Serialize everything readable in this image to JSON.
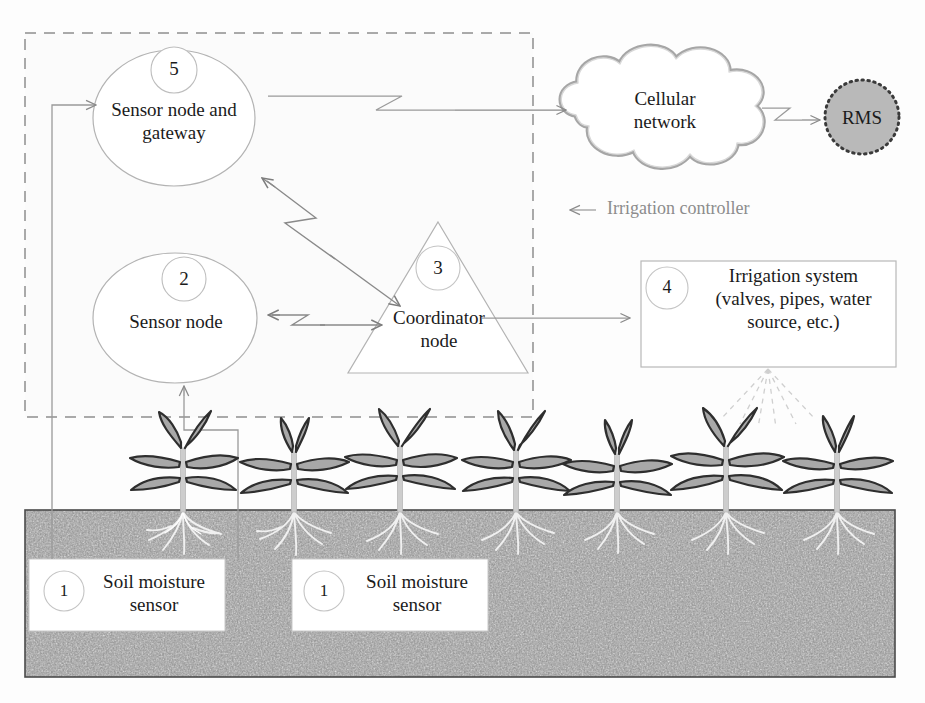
{
  "figure": {
    "boundary_label": "Irrigation controller"
  },
  "nodes": {
    "sensor_node_gateway": {
      "badge": "5",
      "label_line1": "Sensor node and",
      "label_line2": "gateway",
      "shape": "ellipse"
    },
    "sensor_node": {
      "badge": "2",
      "label_line1": "Sensor node",
      "label_line2": "",
      "shape": "ellipse"
    },
    "coordinator_node": {
      "badge": "3",
      "label_line1": "Coordinator",
      "label_line2": "node",
      "shape": "triangle"
    },
    "irrigation_system": {
      "badge": "4",
      "label_line1": "Irrigation system",
      "label_line2": "(valves, pipes, water",
      "label_line3": "source, etc.)",
      "shape": "rectangle"
    },
    "cellular_network": {
      "label_line1": "Cellular",
      "label_line2": "network",
      "shape": "cloud"
    },
    "rms": {
      "label": "RMS",
      "shape": "dotted-circle"
    },
    "soil_sensor_left": {
      "badge": "1",
      "label_line1": "Soil moisture",
      "label_line2": "sensor",
      "shape": "rectangle"
    },
    "soil_sensor_right": {
      "badge": "1",
      "label_line1": "Soil moisture",
      "label_line2": "sensor",
      "shape": "rectangle"
    }
  },
  "connections": [
    {
      "name": "gateway-to-cellular",
      "type": "wireless-arrow",
      "from": "sensor_node_gateway",
      "to": "cellular_network"
    },
    {
      "name": "cellular-to-rms",
      "type": "wireless-arrow",
      "from": "cellular_network",
      "to": "rms"
    },
    {
      "name": "gateway-coordinator",
      "type": "wireless-bidirectional",
      "from": "sensor_node_gateway",
      "to": "coordinator_node"
    },
    {
      "name": "sensornode-coordinator",
      "type": "wireless-bidirectional",
      "from": "sensor_node",
      "to": "coordinator_node"
    },
    {
      "name": "coordinator-to-irrigation",
      "type": "arrow",
      "from": "coordinator_node",
      "to": "irrigation_system"
    },
    {
      "name": "soil-sensor-left-to-gateway",
      "type": "wired-arrow",
      "from": "soil_sensor_left",
      "to": "sensor_node_gateway"
    },
    {
      "name": "soil-sensor-right-to-sensornode",
      "type": "wired-arrow",
      "from": "soil_sensor_right",
      "to": "sensor_node"
    },
    {
      "name": "irrigation-water-spray",
      "type": "dashed-fan",
      "from": "irrigation_system",
      "to": "field"
    }
  ],
  "scene": {
    "plant_count": 7,
    "soil_label": "soil bed with plant roots"
  },
  "colors": {
    "stroke_gray": "#9a9a9a",
    "arrow_gray": "#8a8a8a",
    "dashed_boundary": "#8f8f8f",
    "cloud_outline": "#a6a6a6",
    "rms_fill": "#b9b9b9",
    "rms_border": "#3a3a3a",
    "plant_fill": "#a8a8a8",
    "plant_stroke": "#2e2e2e",
    "soil_base": "#8e8e8e",
    "text_dark": "#1b1b1b",
    "text_gray": "#8c8c8c",
    "box_border": "#b0b0b0"
  }
}
